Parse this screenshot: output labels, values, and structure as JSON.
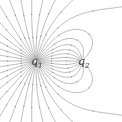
{
  "diagram": {
    "charges": [
      {
        "id": "q1",
        "label": "q",
        "subscript": "1",
        "x": 36,
        "y": 61
      },
      {
        "id": "q2",
        "label": "q",
        "subscript": "2",
        "x": 82,
        "y": 61
      }
    ],
    "line_color": "#8a8a8a",
    "background": "#ffffff"
  }
}
